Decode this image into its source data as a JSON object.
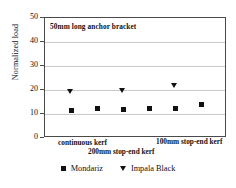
{
  "chart_data": {
    "type": "scatter",
    "title": "",
    "annotation": "50mm long anchor bracket",
    "xlabel": "",
    "ylabel": "Normalized load",
    "ylim": [
      0,
      50
    ],
    "yticks": [
      0,
      10,
      20,
      30,
      40,
      50
    ],
    "grid": true,
    "legend_position": "bottom",
    "x_category_labels": [
      "continuous kerf",
      "100mm stop-end kerf",
      "200mm stop-end kerf"
    ],
    "x": [
      1,
      2,
      3,
      4,
      5,
      6
    ],
    "series": [
      {
        "name": "Mondariz",
        "marker": "square",
        "color": "#111111",
        "values": [
          11.5,
          12.4,
          11.9,
          12.3,
          12.5,
          13.9
        ]
      },
      {
        "name": "Impala Black",
        "marker": "triangle-down",
        "color": "#111111",
        "x": [
          1,
          3,
          5
        ],
        "values": [
          19.3,
          19.7,
          22.0
        ]
      }
    ]
  },
  "legend": {
    "entries": [
      {
        "label": "Mondariz",
        "icon": "square-marker-icon"
      },
      {
        "label": "Impala Black",
        "icon": "triangle-down-marker-icon"
      }
    ]
  }
}
